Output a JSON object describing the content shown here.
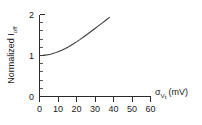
{
  "chart_data": {
    "type": "line",
    "title": "",
    "xlabel": "σ_Vt (mV)",
    "xlabel_main": "σ",
    "xlabel_sub": "V",
    "xlabel_sub2": "t",
    "xlabel_units": "(mV)",
    "ylabel": "Normalized I_off",
    "ylabel_main": "Normalized I",
    "ylabel_sub": "off",
    "xlim": [
      0,
      60
    ],
    "ylim": [
      0,
      2
    ],
    "xticks": [
      0,
      10,
      20,
      30,
      40,
      50,
      60
    ],
    "xtick_labels": [
      "0",
      "10",
      "20",
      "30",
      "40",
      "50",
      "60"
    ],
    "yticks": [
      0,
      1,
      2
    ],
    "ytick_labels": [
      "0",
      "1",
      "2"
    ],
    "y_minor_step": 0.2,
    "x_minor_ticks": false,
    "grid": false,
    "legend": null,
    "series": [
      {
        "name": "Normalized Ioff",
        "color": "#3a3a3a",
        "x": [
          0,
          2,
          4,
          6,
          8,
          10,
          12,
          14,
          16,
          18,
          20,
          22,
          24,
          26,
          28,
          30,
          32,
          34,
          36,
          38,
          40,
          42,
          44,
          46,
          48,
          50
        ],
        "y": [
          1.0,
          1.004,
          1.015,
          1.033,
          1.058,
          1.09,
          1.128,
          1.172,
          1.221,
          1.275,
          1.333,
          1.394,
          1.458,
          1.524,
          1.591,
          1.659,
          1.728,
          1.797,
          1.866,
          1.935,
          2.004,
          2.072,
          2.139,
          2.205,
          2.27,
          2.333
        ]
      }
    ]
  },
  "colors": {
    "axis": "#2b2b2b",
    "curve": "#3a3a3a",
    "background": "#ffffff",
    "text": "#1a1a1a"
  }
}
